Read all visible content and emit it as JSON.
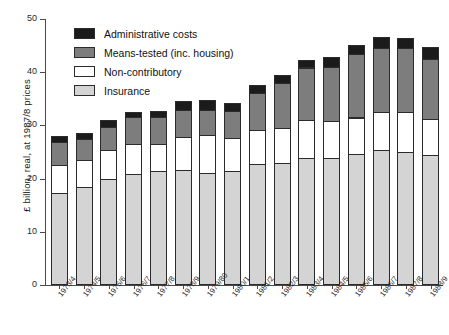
{
  "chart_data": {
    "type": "bar",
    "stacked": true,
    "title": "",
    "xlabel": "",
    "ylabel": "£ billion, real, at 1987/8 prices",
    "ylim": [
      0,
      50
    ],
    "yticks": [
      0,
      10,
      20,
      30,
      40,
      50
    ],
    "ytick_labels": [
      "0",
      "10",
      "20",
      "30",
      "40",
      "50"
    ],
    "grid": false,
    "legend_position": "top-left",
    "categories": [
      "1973/4",
      "1974/5",
      "1975/6",
      "1976/7",
      "1977/8",
      "1978/9",
      "1979/80",
      "1980/1",
      "1981/2",
      "1982/3",
      "1983/4",
      "1984/5",
      "1985/6",
      "1986/7",
      "1987/8",
      "1988/9"
    ],
    "series": [
      {
        "name": "Insurance",
        "color": "#d4d4d4",
        "values": [
          17.2,
          18.3,
          19.7,
          20.7,
          21.2,
          21.5,
          20.9,
          21.3,
          22.6,
          22.8,
          23.7,
          23.7,
          24.4,
          25.2,
          24.8,
          24.3
        ]
      },
      {
        "name": "Non-contributory",
        "color": "#ffffff",
        "values": [
          5.1,
          5.0,
          5.4,
          5.7,
          5.2,
          6.2,
          7.1,
          6.1,
          6.3,
          6.5,
          7.1,
          7.0,
          6.9,
          7.2,
          7.5,
          6.8
        ]
      },
      {
        "name": "Means-tested (inc. housing)",
        "color": "#7d7d7d",
        "values": [
          4.4,
          4.0,
          4.4,
          5.0,
          5.0,
          5.0,
          4.7,
          5.2,
          7.0,
          8.5,
          9.9,
          10.1,
          11.9,
          11.9,
          12.1,
          11.2
        ]
      },
      {
        "name": "Administrative costs",
        "color": "#1b1b1b",
        "values": [
          1.2,
          1.1,
          1.3,
          1.0,
          1.1,
          1.7,
          1.8,
          1.5,
          1.5,
          1.5,
          1.5,
          1.8,
          1.8,
          2.2,
          1.8,
          2.3
        ]
      }
    ],
    "totals": [
      27.9,
      28.4,
      30.8,
      32.4,
      32.5,
      34.4,
      34.5,
      34.1,
      37.4,
      39.3,
      42.2,
      42.6,
      45.0,
      46.5,
      46.2,
      44.6
    ]
  },
  "legend": {
    "items": [
      {
        "label": "Administrative costs",
        "swatch": "admin"
      },
      {
        "label": "Means-tested (inc. housing)",
        "swatch": "means"
      },
      {
        "label": "Non-contributory",
        "swatch": "noncontrib"
      },
      {
        "label": "Insurance",
        "swatch": "insurance"
      }
    ]
  }
}
